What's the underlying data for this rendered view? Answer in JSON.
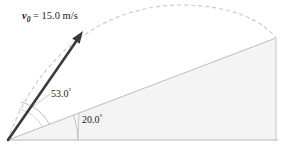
{
  "figure": {
    "name": "projectile-launched-up-incline",
    "background_color": "#ffffff"
  },
  "labels": {
    "velocity": {
      "symbol": "v",
      "subscript": "0",
      "equals": " = ",
      "value": "15.0",
      "unit": " m/s",
      "full_text": "v0 = 15.0 m/s"
    },
    "launch_angle": {
      "value": "53.0",
      "degree_symbol": "°",
      "full_text": "53.0°"
    },
    "incline_angle": {
      "value": "20.0",
      "degree_symbol": "°",
      "full_text": "20.0°"
    }
  },
  "colors": {
    "arrow": "#3b3b3b",
    "trajectory_dash": "#c9c9c9",
    "incline_fill": "#f4f4f4",
    "incline_stroke": "#b4b4b4",
    "baseline_stroke": "#b0b0b0",
    "arc_stroke": "#b9b9b9",
    "leader_stroke": "#bdbdbd",
    "text": "#1a1a1a"
  },
  "geometry": {
    "origin": {
      "x": 8,
      "y": 140
    },
    "baseline_end": {
      "x": 278,
      "y": 140
    },
    "incline_apex": {
      "x": 276,
      "y": 38
    },
    "incline_bottom_right": {
      "x": 276,
      "y": 140
    },
    "arrow_tip": {
      "x": 83,
      "y": 32
    },
    "trajectory_peak": {
      "x": 180,
      "y": 5
    },
    "incline_angle_degrees": 20.0,
    "launch_angle_from_incline_degrees": 53.0,
    "launch_angle_from_horizontal_degrees": 73.0
  }
}
